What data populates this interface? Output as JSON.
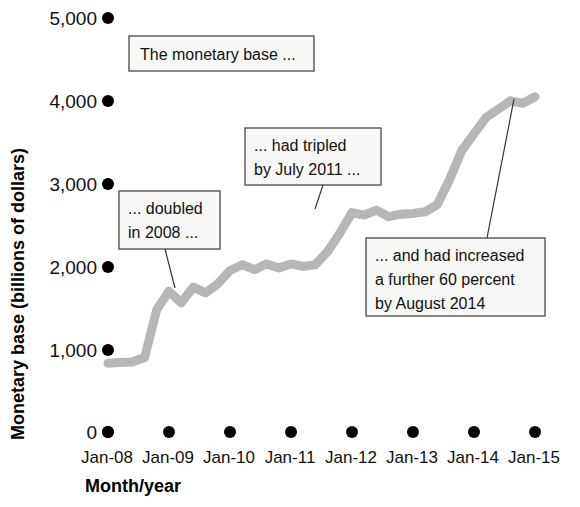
{
  "chart_data": {
    "type": "line",
    "title": "",
    "xlabel": "Month/year",
    "ylabel": "Monetary base (billions of dollars)",
    "ylim": [
      0,
      5000
    ],
    "yticks": [
      0,
      1000,
      2000,
      3000,
      4000,
      5000
    ],
    "ytick_labels": [
      "0",
      "1,000",
      "2,000",
      "3,000",
      "4,000",
      "5,000"
    ],
    "xtick_labels": [
      "Jan-08",
      "Jan-09",
      "Jan-10",
      "Jan-11",
      "Jan-12",
      "Jan-13",
      "Jan-14",
      "Jan-15"
    ],
    "grid": false,
    "legend": "none",
    "line_color": "#b6b6b6",
    "series": [
      {
        "name": "Monetary base",
        "x": [
          "Jan-08",
          "Apr-08",
          "Jul-08",
          "Sep-08",
          "Oct-08",
          "Dec-08",
          "Feb-09",
          "Apr-09",
          "Jun-09",
          "Aug-09",
          "Oct-09",
          "Dec-09",
          "Feb-10",
          "Apr-10",
          "Jun-10",
          "Aug-10",
          "Oct-10",
          "Dec-10",
          "Feb-11",
          "Apr-11",
          "Jul-11",
          "Oct-11",
          "Jan-12",
          "Apr-12",
          "Jul-12",
          "Oct-12",
          "Dec-12",
          "Mar-13",
          "Jun-13",
          "Sep-13",
          "Dec-13",
          "Mar-14",
          "Jun-14",
          "Aug-14",
          "Nov-14",
          "Jan-15"
        ],
        "values": [
          830,
          840,
          845,
          900,
          1480,
          1700,
          1560,
          1750,
          1680,
          1790,
          1950,
          2020,
          1960,
          2030,
          1980,
          2030,
          2000,
          2020,
          2180,
          2400,
          2650,
          2620,
          2680,
          2600,
          2630,
          2640,
          2660,
          2750,
          3050,
          3400,
          3600,
          3800,
          3900,
          4000,
          3970,
          4050
        ]
      }
    ],
    "annotations": [
      {
        "id": "monetary-base",
        "text_lines": [
          "The monetary base ..."
        ]
      },
      {
        "id": "doubled-2008",
        "text_lines": [
          "... doubled",
          "in 2008 ..."
        ]
      },
      {
        "id": "tripled-2011",
        "text_lines": [
          "... had tripled",
          "by July 2011 ..."
        ]
      },
      {
        "id": "increased-2014",
        "text_lines": [
          "... and had increased",
          "a further 60 percent",
          "by August 2014"
        ]
      }
    ]
  },
  "axes": {
    "y_title": "Monetary base (billions of dollars)",
    "x_title": "Month/year",
    "y_labels": {
      "t5000": "5,000",
      "t4000": "4,000",
      "t3000": "3,000",
      "t2000": "2,000",
      "t1000": "1,000",
      "t0": "0"
    },
    "x_labels": {
      "x0": "Jan-08",
      "x1": "Jan-09",
      "x2": "Jan-10",
      "x3": "Jan-11",
      "x4": "Jan-12",
      "x5": "Jan-13",
      "x6": "Jan-14",
      "x7": "Jan-15"
    }
  },
  "callouts": {
    "monetary_base": "The monetary base ...",
    "doubled_l1": "... doubled",
    "doubled_l2": "in 2008 ...",
    "tripled_l1": "... had tripled",
    "tripled_l2": "by July 2011 ...",
    "increased_l1": "... and had increased",
    "increased_l2": "a further 60 percent",
    "increased_l3": "by August 2014"
  },
  "colors": {
    "line": "#b6b6b6",
    "callout_fill": "#f7f7f5",
    "callout_stroke": "#555555",
    "text": "#111111"
  }
}
